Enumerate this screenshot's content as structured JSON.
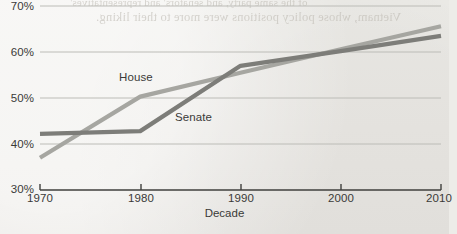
{
  "chart_data": {
    "type": "line",
    "title": "",
    "xlabel": "Decade",
    "ylabel": "",
    "x": [
      1970,
      1980,
      1990,
      2000,
      2010
    ],
    "xlim": [
      1970,
      2010
    ],
    "ylim": [
      30,
      70
    ],
    "yticks": [
      30,
      40,
      50,
      60,
      70
    ],
    "ytick_labels": [
      "30%",
      "40%",
      "50%",
      "60%",
      "70%"
    ],
    "xtick_labels": [
      "1970",
      "1980",
      "1990",
      "2000",
      "2010"
    ],
    "grid": "horizontal",
    "legend": "inline-labels",
    "series": [
      {
        "name": "House",
        "color": "#a6a6a1",
        "values": [
          37.0,
          50.3,
          55.5,
          60.6,
          65.6
        ]
      },
      {
        "name": "Senate",
        "color": "#7d7d79",
        "values": [
          42.2,
          42.8,
          57.0,
          60.2,
          63.5
        ]
      }
    ]
  },
  "axes": {
    "y_ticks": [
      {
        "label": "70%",
        "value": 70
      },
      {
        "label": "60%",
        "value": 60
      },
      {
        "label": "50%",
        "value": 50
      },
      {
        "label": "40%",
        "value": 40
      },
      {
        "label": "30%",
        "value": 30
      }
    ],
    "x_ticks": [
      {
        "label": "1970",
        "value": 1970
      },
      {
        "label": "1980",
        "value": 1980
      },
      {
        "label": "1990",
        "value": 1990
      },
      {
        "label": "2000",
        "value": 2000
      },
      {
        "label": "2010",
        "value": 2010
      }
    ],
    "x_axis_title": "Decade"
  },
  "series_labels": {
    "house": "House",
    "senate": "Senate"
  },
  "colors": {
    "house_line": "#a6a6a1",
    "senate_line": "#7d7d79",
    "gridline": "#bcbcb7",
    "axis": "#3f3f3d",
    "text": "#3a3a38",
    "paper": "#edece8"
  },
  "page_artifacts": {
    "bleed_through_line_1": "of the same party, and senators' and representatives'",
    "bleed_through_line_2": "Vietnam, whose policy positions were more to their liking."
  }
}
